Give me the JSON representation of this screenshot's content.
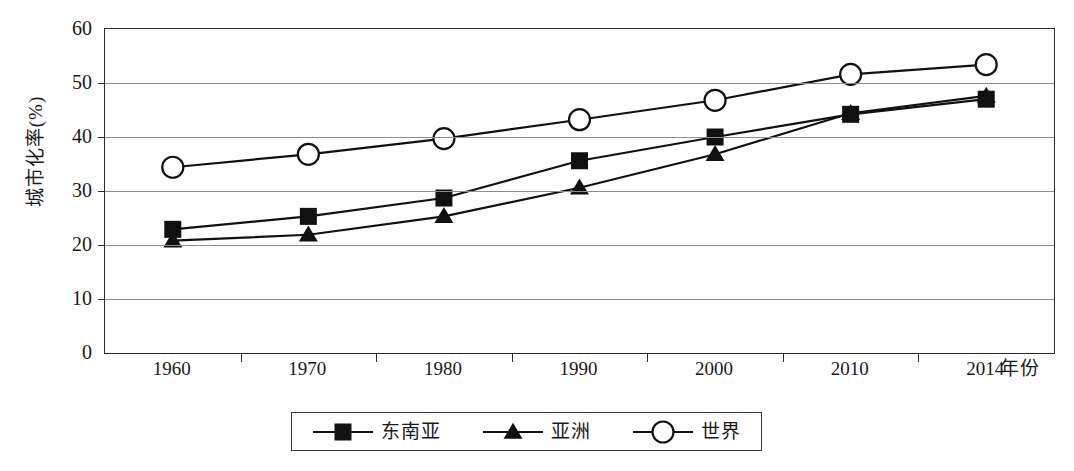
{
  "clipped_header_text": "",
  "chart_data": {
    "type": "line",
    "title": "",
    "xlabel": "年份",
    "ylabel": "城市化率(%)",
    "categories": [
      "1960",
      "1970",
      "1980",
      "1990",
      "2000",
      "2010",
      "2014"
    ],
    "ylim": [
      0,
      60
    ],
    "ytick_labels": [
      "60",
      "50",
      "40",
      "30",
      "20",
      "10",
      "0"
    ],
    "ytick_values": [
      60,
      50,
      40,
      30,
      20,
      10,
      0
    ],
    "grid": "horizontal",
    "legend_position": "bottom",
    "series": [
      {
        "name": "东南亚",
        "marker": "filled-square",
        "color": "#111111",
        "values": [
          22.9,
          25.3,
          28.7,
          35.6,
          40.0,
          44.2,
          47.0
        ]
      },
      {
        "name": "亚洲",
        "marker": "filled-triangle",
        "color": "#111111",
        "values": [
          20.8,
          21.9,
          25.3,
          30.6,
          36.8,
          44.4,
          47.6
        ]
      },
      {
        "name": "世界",
        "marker": "open-circle",
        "color": "#111111",
        "values": [
          34.4,
          36.8,
          39.7,
          43.2,
          46.8,
          51.6,
          53.4
        ]
      }
    ]
  },
  "legend": {
    "items": [
      {
        "label": "东南亚",
        "marker": "filled-square"
      },
      {
        "label": "亚洲",
        "marker": "filled-triangle"
      },
      {
        "label": "世界",
        "marker": "open-circle"
      }
    ]
  },
  "axes": {
    "y_title": "城市化率(%)",
    "x_title": "年份"
  },
  "colors": {
    "axis": "#2b2b2b",
    "grid": "#8e8e8e",
    "ink": "#111111",
    "background": "#ffffff"
  }
}
